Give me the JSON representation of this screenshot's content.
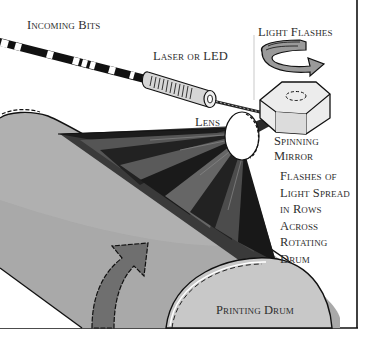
{
  "diagram": {
    "type": "laser-printer-mechanism",
    "colors": {
      "background": "#ffffff",
      "ink": "#111111",
      "drum_gray": "#a9a9a9",
      "drum_end_gray": "#c8c8c8",
      "arrow_gray": "#6f6f6f",
      "beam_dark": "#1a1a1a",
      "beam_mid": "#555555",
      "label_text": "#2e2e2e"
    },
    "labels": {
      "incoming_bits": "Incoming Bits",
      "laser_or_led": "Laser or LED",
      "light_flashes": "Light Flashes",
      "lens": "Lens",
      "spinning_mirror": [
        "Spinning",
        "Mirror"
      ],
      "flashes_description": [
        "Flashes of",
        "Light Spread",
        "in Rows",
        "Across",
        "Rotating",
        "Drum"
      ],
      "printing_drum": "Printing Drum"
    },
    "components": [
      {
        "name": "incoming-bits-stream",
        "label_ref": "incoming_bits"
      },
      {
        "name": "laser-emitter",
        "label_ref": "laser_or_led"
      },
      {
        "name": "rotation-arrow-mirror",
        "label_ref": "light_flashes"
      },
      {
        "name": "spinning-mirror",
        "label_ref": "spinning_mirror"
      },
      {
        "name": "lens",
        "label_ref": "lens"
      },
      {
        "name": "light-fan",
        "label_ref": "flashes_description"
      },
      {
        "name": "printing-drum",
        "label_ref": "printing_drum"
      },
      {
        "name": "drum-rotation-arrow"
      }
    ]
  }
}
